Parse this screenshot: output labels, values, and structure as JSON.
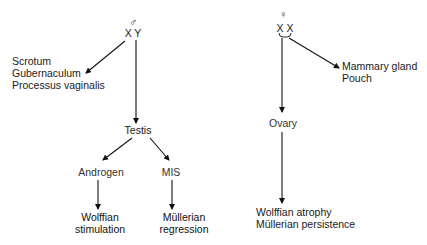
{
  "diagram": {
    "male": {
      "symbol": "♂",
      "genotype": "X Y",
      "external_targets": [
        "Scrotum",
        "Gubernaculum",
        "Processus vaginalis"
      ],
      "gonad": "Testis",
      "hormones": [
        {
          "label": "Androgen",
          "effect_line1": "Wolffian",
          "effect_line2": "stimulation"
        },
        {
          "label": "MIS",
          "effect_line1": "Müllerian",
          "effect_line2": "regression"
        }
      ]
    },
    "female": {
      "symbol": "♀",
      "genotype": "X X",
      "external_targets": [
        "Mammary gland",
        "Pouch"
      ],
      "gonad": "Ovary",
      "effects": [
        "Wolffian atrophy",
        "Müllerian persistence"
      ]
    }
  }
}
